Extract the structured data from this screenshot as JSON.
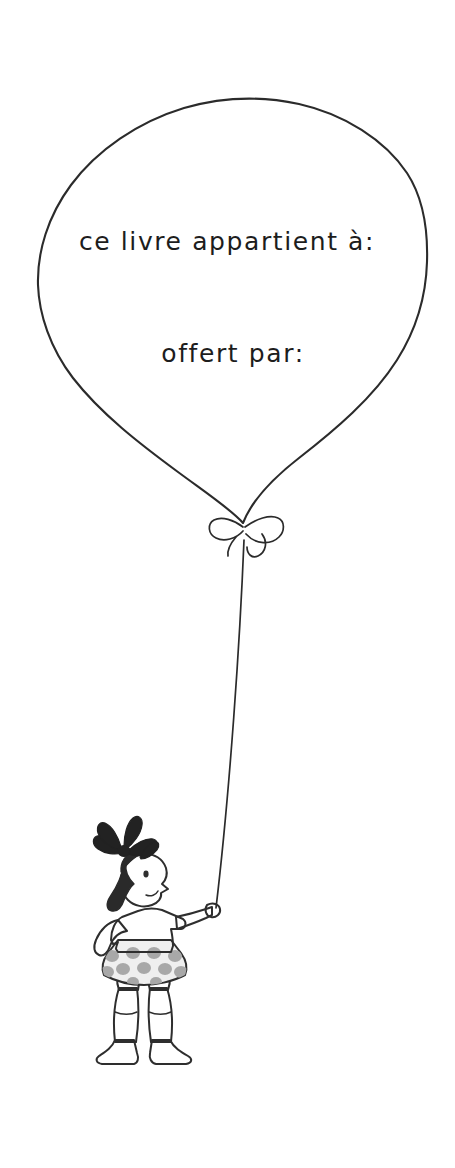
{
  "page": {
    "background_color": "#ffffff",
    "width": 455,
    "height": 1168
  },
  "balloon": {
    "name": "balloon",
    "ink_color": "#2b2b2b",
    "fill_color": "#ffffff",
    "lines": [
      {
        "id": "owner-line",
        "text": "ce livre appartient à:"
      },
      {
        "id": "giver-line",
        "text": "offert par:"
      }
    ],
    "knot": {
      "name": "bow-knot"
    },
    "string": {
      "name": "balloon-string"
    }
  },
  "girl": {
    "name": "girl-figure",
    "description": "girl holding balloon string",
    "colors": {
      "outline": "#2e2e2e",
      "hair": "#2a2a2a",
      "bow": "#222222",
      "skin": "#f7f7f7",
      "shirt": "#9a9a9a",
      "skirt": "#efefef",
      "skirt_dots": "#a8a8a8",
      "socks": "#ededed",
      "shoes": "#8c8c8c"
    },
    "parts": [
      "hair-bow",
      "hair",
      "face",
      "eye",
      "nose",
      "mouth",
      "shirt",
      "left-arm-on-hip",
      "right-arm-raised",
      "hand",
      "skirt",
      "legs",
      "socks",
      "shoes"
    ]
  }
}
